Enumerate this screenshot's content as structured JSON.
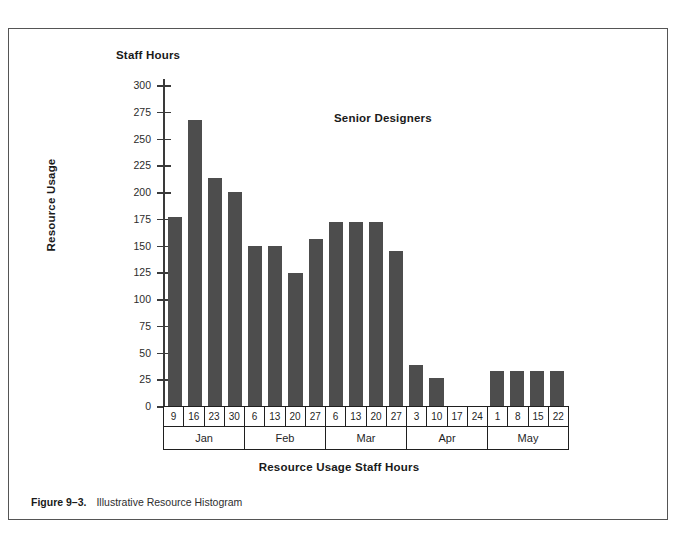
{
  "figure": {
    "caption_number": "Figure 9–3.",
    "caption_text": "Illustrative Resource Histogram"
  },
  "chart_data": {
    "type": "bar",
    "title": "Staff Hours",
    "series_annotation": "Senior Designers",
    "xlabel": "Resource Usage Staff Hours",
    "ylabel": "Resource Usage",
    "ylim": [
      0,
      300
    ],
    "ytick_labels": [
      "300",
      "275",
      "250",
      "225",
      "200",
      "175",
      "150",
      "125",
      "100",
      "75",
      "50",
      "25",
      "0"
    ],
    "yticks": [
      300,
      275,
      250,
      225,
      200,
      175,
      150,
      125,
      100,
      75,
      50,
      25,
      0
    ],
    "grid": false,
    "legend_position": "none",
    "bar_color": "#4d4d4d",
    "categories": [
      "9",
      "16",
      "23",
      "30",
      "6",
      "13",
      "20",
      "27",
      "6",
      "13",
      "20",
      "27",
      "3",
      "10",
      "17",
      "24",
      "1",
      "8",
      "15",
      "22"
    ],
    "values": [
      177,
      267,
      213,
      200,
      150,
      150,
      124,
      156,
      172,
      172,
      172,
      145,
      38,
      26,
      0,
      0,
      33,
      33,
      33,
      33
    ],
    "groups": [
      {
        "label": "Jan",
        "days": [
          "9",
          "16",
          "23",
          "30"
        ],
        "values": [
          177,
          267,
          213,
          200
        ]
      },
      {
        "label": "Feb",
        "days": [
          "6",
          "13",
          "20",
          "27"
        ],
        "values": [
          150,
          150,
          124,
          156
        ]
      },
      {
        "label": "Mar",
        "days": [
          "6",
          "13",
          "20",
          "27"
        ],
        "values": [
          172,
          172,
          172,
          145
        ]
      },
      {
        "label": "Apr",
        "days": [
          "3",
          "10",
          "17",
          "24"
        ],
        "values": [
          38,
          26,
          0,
          0
        ]
      },
      {
        "label": "May",
        "days": [
          "1",
          "8",
          "15",
          "22"
        ],
        "values": [
          33,
          33,
          33,
          33
        ]
      }
    ]
  }
}
